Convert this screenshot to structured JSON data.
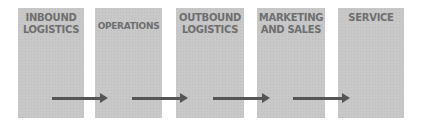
{
  "diagram": {
    "stages": [
      {
        "label": "INBOUND LOGISTICS"
      },
      {
        "label": "OPERATIONS"
      },
      {
        "label": "OUTBOUND LOGISTICS"
      },
      {
        "label": "MARKETING AND SALES"
      },
      {
        "label": "SERVICE"
      }
    ],
    "colors": {
      "box": "#c8c8c8",
      "text": "#6f6f6f",
      "arrow": "#555555"
    }
  }
}
